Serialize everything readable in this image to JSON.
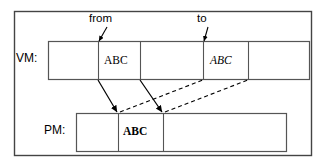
{
  "figure": {
    "type": "diagram",
    "background_color": "#ffffff",
    "line_color": "#000000",
    "outer_frame": {
      "x": 14,
      "y": 11,
      "width": 298,
      "height": 145
    }
  },
  "rows": [
    {
      "id": "vm",
      "label": "VM:",
      "label_x": 16,
      "label_y": 40,
      "box": {
        "x": 48,
        "y": 41,
        "width": 262,
        "height": 39
      },
      "dividers_x": [
        98,
        140,
        203,
        248
      ],
      "cells": [
        {
          "id": "vm-cell-1",
          "text": "",
          "style": "normal"
        },
        {
          "id": "vm-cell-2",
          "text": "ABC",
          "style": "normal",
          "text_x": 105,
          "text_y": 57
        },
        {
          "id": "vm-cell-3",
          "text": "",
          "style": "normal"
        },
        {
          "id": "vm-cell-4",
          "text": "ABC",
          "style": "italic",
          "text_x": 211,
          "text_y": 57
        },
        {
          "id": "vm-cell-5",
          "text": "",
          "style": "normal"
        }
      ]
    },
    {
      "id": "pm",
      "label": "PM:",
      "label_x": 44,
      "label_y": 112,
      "box": {
        "x": 76,
        "y": 113,
        "width": 211,
        "height": 39
      },
      "dividers_x": [
        118,
        163
      ],
      "cells": [
        {
          "id": "pm-cell-1",
          "text": "",
          "style": "normal"
        },
        {
          "id": "pm-cell-2",
          "text": "ABC",
          "style": "bold",
          "text_x": 124,
          "text_y": 127
        },
        {
          "id": "pm-cell-3",
          "text": "",
          "style": "normal"
        }
      ]
    }
  ],
  "callouts": [
    {
      "id": "from",
      "label": "from",
      "label_x": 89,
      "label_y": 13,
      "pointer": {
        "x1": 107,
        "y1": 28,
        "x2": 98,
        "y2": 41
      }
    },
    {
      "id": "to",
      "label": "to",
      "label_x": 197,
      "label_y": 13,
      "pointer": {
        "x1": 208,
        "y1": 28,
        "x2": 203,
        "y2": 41
      }
    }
  ],
  "connectors": {
    "solid": [
      {
        "id": "copy-arrow-left",
        "x1": 98,
        "y1": 80,
        "x2": 118,
        "y2": 113,
        "style": "solid",
        "arrowhead": "end"
      },
      {
        "id": "copy-arrow-right",
        "x1": 140,
        "y1": 80,
        "x2": 163,
        "y2": 113,
        "style": "solid",
        "arrowhead": "end"
      }
    ],
    "dashed": [
      {
        "id": "map-dash-left",
        "x1": 118,
        "y1": 113,
        "x2": 203,
        "y2": 80,
        "style": "dashed",
        "arrowhead": "none"
      },
      {
        "id": "map-dash-right",
        "x1": 163,
        "y1": 113,
        "x2": 248,
        "y2": 80,
        "style": "dashed",
        "arrowhead": "none"
      }
    ]
  },
  "legend_note": {
    "vm_meaning": "VM",
    "pm_meaning": "PM"
  }
}
